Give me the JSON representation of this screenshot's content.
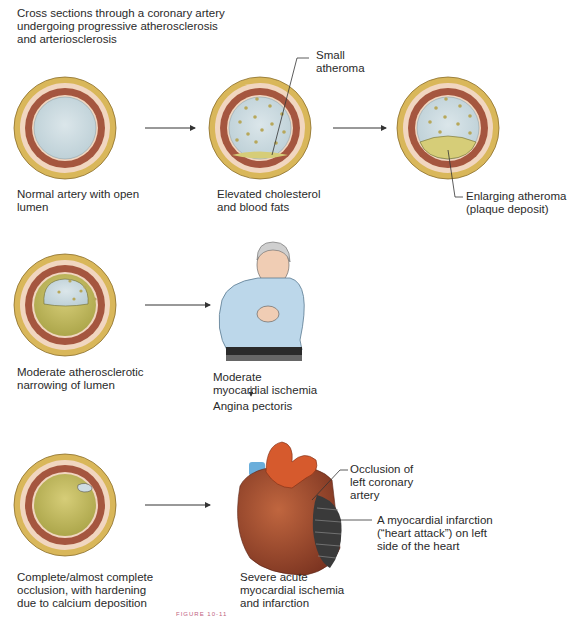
{
  "title": "Cross sections through a coronary artery\nundergoing progressive atherosclerosis\nand arteriosclerosis",
  "stages": [
    {
      "id": "normal",
      "label": "Normal artery with open\nlumen"
    },
    {
      "id": "elevated",
      "label": "Elevated cholesterol\nand blood fats",
      "callout": "Small\natheroma"
    },
    {
      "id": "enlarging",
      "label": "Enlarging atheroma\n(plaque deposit)"
    },
    {
      "id": "moderate",
      "label": "Moderate atherosclerotic\nnarrowing of lumen"
    },
    {
      "id": "occlusion",
      "label": "Complete/almost complete\nocclusion, with hardening\ndue to calcium deposition"
    }
  ],
  "outcomes": {
    "ischemia": {
      "label": "Moderate\nmyocardial ischemia",
      "result": "Angina pectoris"
    },
    "infarction": {
      "label": "Severe acute\nmyocardial ischemia\nand infarction",
      "callout_occlusion": "Occlusion of\nleft coronary\nartery",
      "callout_infarct": "A myocardial infarction\n(“heart attack”) on left\nside of the heart"
    }
  },
  "figure_caption": "FIGURE 10-11",
  "colors": {
    "adventitia": "#d9b75a",
    "media_light": "#f1d6c0",
    "media_dark": "#a5563f",
    "lumen": "#cfdde3",
    "plaque": "#c9c066",
    "infarct": "#3a3a3a"
  }
}
